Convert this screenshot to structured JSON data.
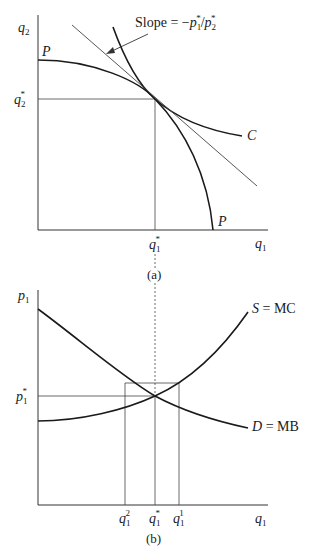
{
  "figure": {
    "panel_a": {
      "caption": "(a)",
      "y_axis_label": "q",
      "y_axis_sub": "2",
      "x_axis_label": "q",
      "x_axis_sub": "1",
      "y_tick_label": "q",
      "y_tick_sub": "2",
      "y_tick_sup": "*",
      "x_tick_label": "q",
      "x_tick_sub": "1",
      "x_tick_sup": "*",
      "ppf_label_top": "P",
      "ppf_label_bottom": "P",
      "indifference_label": "C",
      "slope_annotation": "Slope = −p₁*/p₂*",
      "slope_prefix": "Slope = −",
      "slope_num": "p",
      "slope_num_sub": "1",
      "slope_den": "p",
      "slope_den_sub": "2",
      "star": "*",
      "slash": "/"
    },
    "panel_b": {
      "caption": "(b)",
      "y_axis_label": "p",
      "y_axis_sub": "1",
      "x_axis_label": "q",
      "x_axis_sub": "1",
      "y_tick_label": "p",
      "y_tick_sub": "1",
      "y_tick_sup": "*",
      "supply_label": "S = MC",
      "demand_label_italic": "D",
      "demand_label_rest": " = MB",
      "x_ticks": [
        {
          "base": "q",
          "sub": "1",
          "sup": "2"
        },
        {
          "base": "q",
          "sub": "1",
          "sup": "*"
        },
        {
          "base": "q",
          "sub": "1",
          "sup": "1"
        }
      ]
    },
    "colors": {
      "curve": "#1a1a1a",
      "axis": "#333333",
      "guide": "#444444"
    }
  }
}
